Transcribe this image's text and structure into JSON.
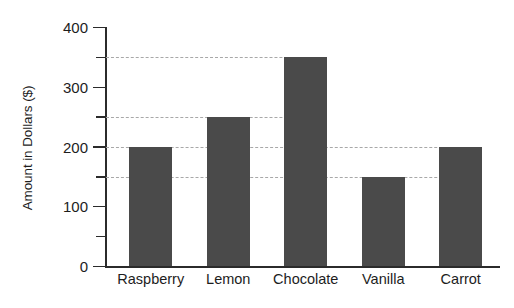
{
  "chart_data": {
    "type": "bar",
    "title": "",
    "subtitle": "",
    "xlabel": "",
    "ylabel": "Amount in Dollars ($)",
    "categories": [
      "Raspberry",
      "Lemon",
      "Chocolate",
      "Vanilla",
      "Carrot"
    ],
    "values": [
      200,
      250,
      350,
      150,
      200
    ],
    "ylim": [
      0,
      400
    ],
    "y_major_ticks": [
      0,
      100,
      200,
      300,
      400
    ],
    "y_major_tick_labels": [
      "0",
      "100",
      "200",
      "300",
      "400"
    ],
    "y_minor_ticks": [
      50,
      150,
      250,
      350
    ],
    "gridlines": [
      350,
      250,
      200,
      150
    ],
    "grid": "horizontal-dashed-to-bar",
    "legend": "none",
    "bar_color": "#4a4a4a",
    "axis_color": "#2b2b2b",
    "gridline_color": "#a8a8a8",
    "background_color": "#ffffff"
  }
}
